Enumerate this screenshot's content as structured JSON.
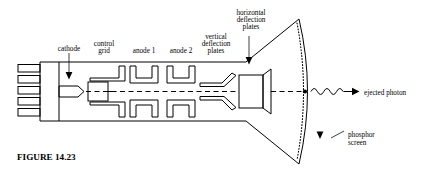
{
  "figure": {
    "caption": "FIGURE 14.23"
  },
  "labels": {
    "cathode": "cathode",
    "control_grid_line1": "control",
    "control_grid_line2": "grid",
    "anode1": "anode 1",
    "anode2": "anode 2",
    "vertical_deflection_line1": "vertical",
    "vertical_deflection_line2": "deflection",
    "vertical_deflection_line3": "plates",
    "horizontal_deflection_line1": "horizontal",
    "horizontal_deflection_line2": "deflection",
    "horizontal_deflection_line3": "plates",
    "ejected_photon": "ejected photon",
    "phosphor_screen_line1": "phosphor",
    "phosphor_screen_line2": "screen"
  },
  "colors": {
    "ink": "#000000",
    "background": "#ffffff"
  },
  "icons": {
    "cathode_pointer": "down-arrow-icon",
    "horizontal_plates_pointer": "down-arrow-icon",
    "phosphor_pointer": "down-arrow-icon",
    "photon_wave": "sine-wave-arrow-icon",
    "beam_axis": "dashed-axis-line"
  }
}
